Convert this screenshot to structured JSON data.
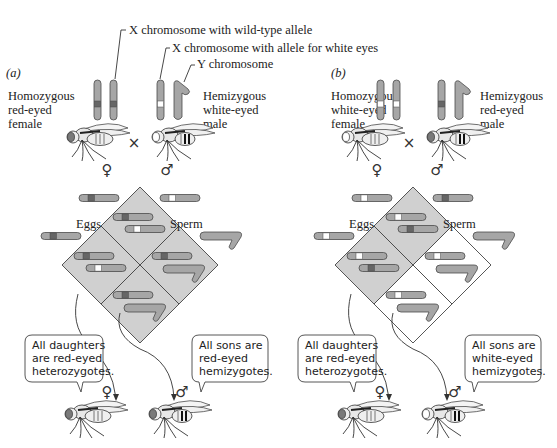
{
  "figure": {
    "callouts": {
      "wild_type_x": "X chromosome with wild-type allele",
      "white_x": "X chromosome with allele for white eyes",
      "y": "Y chromosome"
    },
    "colors": {
      "chromosome": "#a6a6a6",
      "wild_type_band": "#666666",
      "white_band": "#ffffff",
      "outline": "#4a4a4a",
      "square_shaded": "#d0d0d0",
      "square_blank": "#ffffff"
    },
    "symbols": {
      "female": "♀",
      "male": "♂",
      "cross": "×"
    },
    "panels": [
      {
        "label": "(a)",
        "female_label": [
          "Homozygous",
          "red-eyed",
          "female"
        ],
        "male_label": [
          "Hemizygous",
          "white-eyed",
          "male"
        ],
        "female_x_alleles": [
          "wild",
          "wild"
        ],
        "male_x_allele": "white",
        "female_eye": "red",
        "male_eye": "white",
        "eggs_label": "Eggs",
        "sperm_label": "Sperm",
        "eggs": [
          "wild",
          "wild"
        ],
        "sperm": [
          "white",
          "Y"
        ],
        "cells": [
          {
            "pos": "top",
            "chromosomes": [
              "wild",
              "white"
            ],
            "shaded": true
          },
          {
            "pos": "left",
            "chromosomes": [
              "wild",
              "white"
            ],
            "shaded": true
          },
          {
            "pos": "right",
            "chromosomes": [
              "wild",
              "Y"
            ],
            "shaded": true
          },
          {
            "pos": "bottom",
            "chromosomes": [
              "wild",
              "Y"
            ],
            "shaded": true
          }
        ],
        "daughters_text": [
          "All daughters",
          "are red-eyed",
          "heterozygotes."
        ],
        "sons_text": [
          "All sons are",
          "red-eyed",
          "hemizygotes."
        ],
        "daughter_eye": "red",
        "son_eye": "red"
      },
      {
        "label": "(b)",
        "female_label": [
          "Homozygous",
          "white-eyed",
          "female"
        ],
        "male_label": [
          "Hemizygous",
          "red-eyed",
          "male"
        ],
        "female_x_alleles": [
          "white",
          "white"
        ],
        "male_x_allele": "wild",
        "female_eye": "white",
        "male_eye": "red",
        "eggs_label": "Eggs",
        "sperm_label": "Sperm",
        "eggs": [
          "white",
          "white"
        ],
        "sperm": [
          "wild",
          "Y"
        ],
        "cells": [
          {
            "pos": "top",
            "chromosomes": [
              "white",
              "wild"
            ],
            "shaded": true
          },
          {
            "pos": "left",
            "chromosomes": [
              "white",
              "wild"
            ],
            "shaded": true
          },
          {
            "pos": "right",
            "chromosomes": [
              "white",
              "Y"
            ],
            "shaded": false
          },
          {
            "pos": "bottom",
            "chromosomes": [
              "white",
              "Y"
            ],
            "shaded": false
          }
        ],
        "daughters_text": [
          "All daughters",
          "are red-eyed",
          "heterozygotes."
        ],
        "sons_text": [
          "All sons are",
          "white-eyed",
          "hemizygotes."
        ],
        "daughter_eye": "red",
        "son_eye": "white"
      }
    ]
  }
}
